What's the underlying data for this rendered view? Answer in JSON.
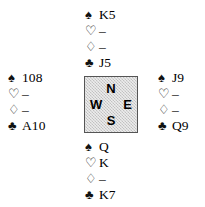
{
  "diagram": {
    "type": "bridge-hand-diagram",
    "suit_symbols": {
      "spade": "♠",
      "heart": "♡",
      "diamond": "♢",
      "club": "♣"
    },
    "compass": {
      "north": "N",
      "south": "S",
      "west": "W",
      "east": "E",
      "box_fill": "#d4d4d4",
      "box_border": "#555555"
    },
    "hands": {
      "north": {
        "label": "North",
        "rows": [
          {
            "suit": "spade",
            "symbol": "♠",
            "cards": "K5",
            "style": "black"
          },
          {
            "suit": "heart",
            "symbol": "♡",
            "cards": "–",
            "style": "hollow"
          },
          {
            "suit": "diamond",
            "symbol": "♢",
            "cards": "–",
            "style": "hollow"
          },
          {
            "suit": "club",
            "symbol": "♣",
            "cards": "J5",
            "style": "black"
          }
        ]
      },
      "west": {
        "label": "West",
        "rows": [
          {
            "suit": "spade",
            "symbol": "♠",
            "cards": "108",
            "style": "black"
          },
          {
            "suit": "heart",
            "symbol": "♡",
            "cards": "–",
            "style": "hollow"
          },
          {
            "suit": "diamond",
            "symbol": "♢",
            "cards": "–",
            "style": "hollow"
          },
          {
            "suit": "club",
            "symbol": "♣",
            "cards": "A10",
            "style": "black"
          }
        ]
      },
      "east": {
        "label": "East",
        "rows": [
          {
            "suit": "spade",
            "symbol": "♠",
            "cards": "J9",
            "style": "black"
          },
          {
            "suit": "heart",
            "symbol": "♡",
            "cards": "–",
            "style": "hollow"
          },
          {
            "suit": "diamond",
            "symbol": "♢",
            "cards": "–",
            "style": "hollow"
          },
          {
            "suit": "club",
            "symbol": "♣",
            "cards": "Q9",
            "style": "black"
          }
        ]
      },
      "south": {
        "label": "South",
        "rows": [
          {
            "suit": "spade",
            "symbol": "♠",
            "cards": "Q",
            "style": "black"
          },
          {
            "suit": "heart",
            "symbol": "♡",
            "cards": "K",
            "style": "hollow"
          },
          {
            "suit": "diamond",
            "symbol": "♢",
            "cards": "–",
            "style": "hollow"
          },
          {
            "suit": "club",
            "symbol": "♣",
            "cards": "K7",
            "style": "black"
          }
        ]
      }
    }
  }
}
